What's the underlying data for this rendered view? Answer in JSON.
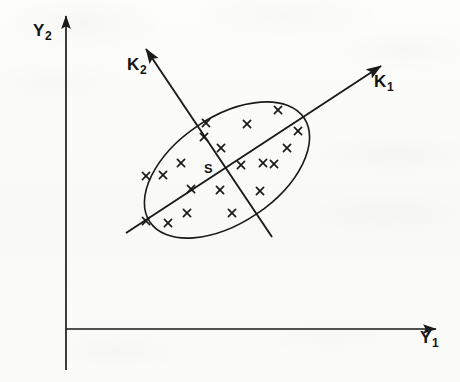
{
  "figure": {
    "type": "scatter",
    "background_color": "#fbfbfa",
    "ink_color": "#1a1a1a",
    "width": 460,
    "height": 382
  },
  "axes": {
    "y1": {
      "label_base": "Y",
      "label_sub": "1",
      "name": "horizontal-axis",
      "origin": [
        66,
        329
      ],
      "tip": [
        443,
        329
      ],
      "arrow": "right",
      "label_pos": [
        420,
        328
      ]
    },
    "y2": {
      "label_base": "Y",
      "label_sub": "2",
      "name": "vertical-axis",
      "origin": [
        66,
        329
      ],
      "tip": [
        66,
        10
      ],
      "tail": [
        66,
        370
      ],
      "arrow": "up",
      "label_pos": [
        33,
        21
      ]
    },
    "k1": {
      "label_base": "K",
      "label_sub": "1",
      "name": "principal-axis-1",
      "tip": [
        387,
        62
      ],
      "tail": [
        126,
        233
      ],
      "arrow": "up-right",
      "label_pos": [
        374,
        72
      ]
    },
    "k2": {
      "label_base": "K",
      "label_sub": "2",
      "name": "principal-axis-2",
      "tip": [
        141,
        43
      ],
      "tail": [
        272,
        237
      ],
      "arrow": "up-left",
      "label_pos": [
        127,
        55
      ]
    }
  },
  "centroid": {
    "label": "S",
    "x": 227,
    "y": 170,
    "label_pos": [
      204,
      161
    ]
  },
  "ellipse": {
    "name": "concentration-ellipse",
    "cx": 227,
    "cy": 170,
    "rx": 93,
    "ry": 53,
    "rotation_deg": -34
  },
  "chart_data": {
    "type": "scatter",
    "title": "",
    "xlabel": "Y1",
    "ylabel": "Y2",
    "marker": "x",
    "grid": false,
    "legend": false,
    "annotations": [
      "Y1",
      "Y2",
      "K1",
      "K2",
      "S"
    ],
    "points_px": [
      [
        206,
        123
      ],
      [
        247,
        124
      ],
      [
        278,
        110
      ],
      [
        221,
        148
      ],
      [
        287,
        148
      ],
      [
        181,
        163
      ],
      [
        263,
        163
      ],
      [
        241,
        165
      ],
      [
        274,
        164
      ],
      [
        163,
        175
      ],
      [
        146,
        176
      ],
      [
        191,
        189
      ],
      [
        220,
        190
      ],
      [
        260,
        191
      ],
      [
        187,
        213
      ],
      [
        232,
        213
      ],
      [
        168,
        223
      ],
      [
        146,
        221
      ],
      [
        204,
        137
      ],
      [
        298,
        131
      ]
    ]
  }
}
